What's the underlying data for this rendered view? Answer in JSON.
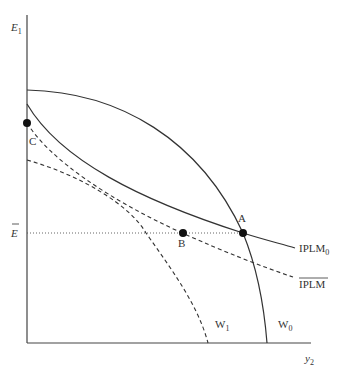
{
  "diagram": {
    "axes": {
      "y_label": "E",
      "y_label_sub": "1",
      "x_label": "y",
      "x_label_sub": "2",
      "ref_level_label": "E",
      "ref_level_bar": true
    },
    "curves": [
      {
        "id": "W0",
        "label": "W",
        "label_sub": "0",
        "style": "solid"
      },
      {
        "id": "IPLM0",
        "label": "IPLM",
        "label_sub": "0",
        "style": "solid"
      },
      {
        "id": "IPLMbar",
        "label": "IPLM",
        "label_sub": "",
        "overline": true,
        "style": "dashed"
      },
      {
        "id": "W1",
        "label": "W",
        "label_sub": "1",
        "style": "dashed"
      }
    ],
    "points": [
      {
        "id": "A",
        "label": "A"
      },
      {
        "id": "B",
        "label": "B"
      },
      {
        "id": "C",
        "label": "C"
      }
    ],
    "colors": {
      "line": "#333333",
      "point": "#111111"
    }
  }
}
